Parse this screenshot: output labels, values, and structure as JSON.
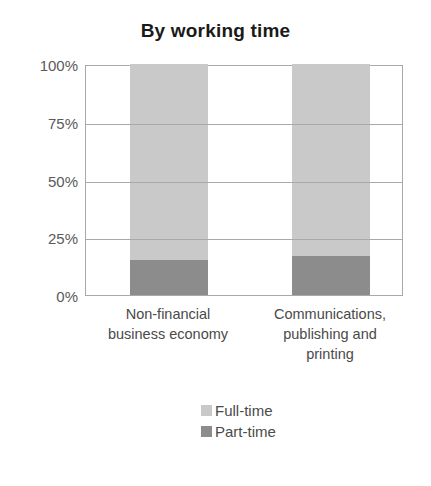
{
  "chart_data": {
    "type": "bar",
    "subtype": "stacked-100-percent",
    "title": "By working time",
    "xlabel": "",
    "ylabel": "",
    "categories": [
      "Non-financial business economy",
      "Communications, publishing and printing"
    ],
    "category_lines": [
      [
        "Non-financial",
        "business economy"
      ],
      [
        "Communications,",
        "publishing and",
        "printing"
      ]
    ],
    "series": [
      {
        "name": "Full-time",
        "values": [
          85,
          83
        ],
        "color": "#c9c9c9"
      },
      {
        "name": "Part-time",
        "values": [
          15,
          17
        ],
        "color": "#8c8c8c"
      }
    ],
    "stack_order_bottom_to_top": [
      "Part-time",
      "Full-time"
    ],
    "ylim": [
      0,
      100
    ],
    "y_ticks": [
      0,
      25,
      50,
      75,
      100
    ],
    "y_tick_labels": [
      "0%",
      "25%",
      "50%",
      "75%",
      "100%"
    ],
    "grid": true,
    "grid_axis": "y",
    "legend_position": "bottom-center",
    "plot_border_color": "#a9a9a9",
    "background_color": "#ffffff"
  },
  "legend": {
    "items": [
      {
        "label": "Full-time",
        "color": "#c9c9c9"
      },
      {
        "label": "Part-time",
        "color": "#8c8c8c"
      }
    ]
  }
}
